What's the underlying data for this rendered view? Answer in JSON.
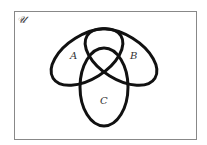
{
  "diagram": {
    "type": "venn",
    "universe_label": "𝒰",
    "sets": [
      {
        "name": "A",
        "label": "A"
      },
      {
        "name": "B",
        "label": "B"
      },
      {
        "name": "C",
        "label": "C"
      }
    ],
    "colors": {
      "stroke": "#111111",
      "frame": "#888888",
      "background": "#ffffff"
    }
  }
}
